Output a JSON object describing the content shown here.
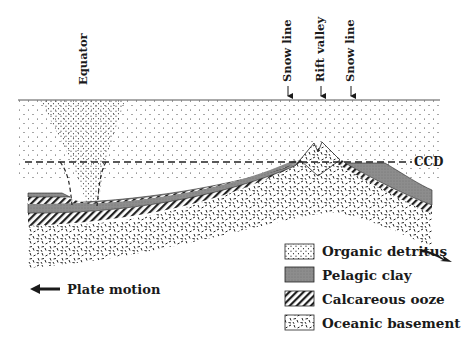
{
  "diagram": {
    "type": "geological cross-section",
    "surface_labels": {
      "equator": "Equator",
      "snow_line_left": "Snow line",
      "rift_valley": "Rift valley",
      "snow_line_right": "Snow line"
    },
    "ccd_label": "CCD",
    "plate_motion_label": "Plate motion",
    "legend": {
      "items": [
        {
          "label": "Organic detritus",
          "pattern": "dots"
        },
        {
          "label": "Pelagic clay",
          "pattern": "gray-fill"
        },
        {
          "label": "Calcareous ooze",
          "pattern": "diagonal-hatch"
        },
        {
          "label": "Oceanic basement",
          "pattern": "dashes"
        }
      ]
    },
    "colors": {
      "ink": "#1a1a1a",
      "clay": "#8a8a8a",
      "background": "#ffffff"
    }
  }
}
